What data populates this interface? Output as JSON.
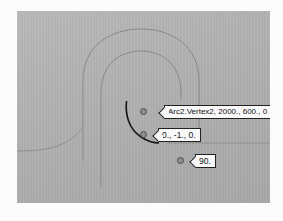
{
  "canvas": {
    "background_color": "#b3b3b3",
    "border_color": "#9a9a9a"
  },
  "geometry": {
    "description": "Two concentric hairpin (U-shaped) guide curves with a highlighted arc segment",
    "guide_curve_color": "#8a8a8a",
    "highlight_curve_color": "#1a1a1a"
  },
  "annotations": {
    "vertex": {
      "label": "Arc2.Vertex2, 2000., 600., 0",
      "marker": "vertex-point-marker"
    },
    "direction": {
      "label": "0., -1., 0.",
      "marker": "direction-point-marker"
    },
    "angle": {
      "label": "90.",
      "marker": "angle-point-marker"
    }
  }
}
